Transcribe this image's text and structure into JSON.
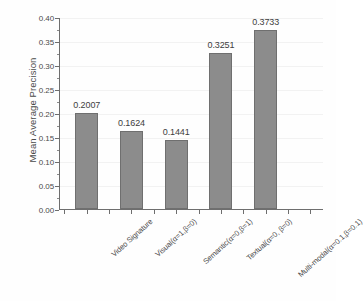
{
  "chart_data": {
    "type": "bar",
    "title": "",
    "xlabel": "",
    "ylabel": "Mean Average Precision",
    "categories": [
      "Video Signature",
      "Visual(α=1,β=0)",
      "Semantic(α=0,β=1)",
      "Textual(α=0, β=0)",
      "Multi-modal(α=0.1,β=0.1)"
    ],
    "values": [
      0.2007,
      0.1624,
      0.1441,
      0.3251,
      0.3733
    ],
    "value_labels": [
      "0.2007",
      "0.1624",
      "0.1441",
      "0.3251",
      "0.3733"
    ],
    "ylim": [
      0.0,
      0.4
    ],
    "ytick_values": [
      0.0,
      0.05,
      0.1,
      0.15,
      0.2,
      0.25,
      0.3,
      0.35,
      0.4
    ],
    "ytick_labels": [
      "0.00",
      "0.05",
      "0.10",
      "0.15",
      "0.20",
      "0.25",
      "0.30",
      "0.35",
      "0.40"
    ],
    "grid": true,
    "legend": null,
    "bar_color": "#8c8c8c",
    "bar_edge_color": "#6f6f6f",
    "axis_color": "#6e6e6e",
    "background_color": "#fefefe"
  }
}
